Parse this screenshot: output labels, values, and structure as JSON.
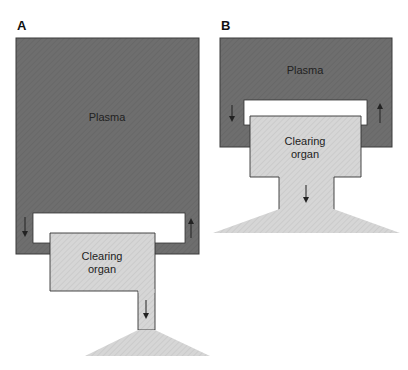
{
  "figure": {
    "panels": [
      {
        "id": "A",
        "label": "A",
        "plasma_label": "Plasma",
        "organ_label_line1": "Clearing",
        "organ_label_line2": "organ",
        "flow_arrows": [
          "down",
          "up",
          "down"
        ]
      },
      {
        "id": "B",
        "label": "B",
        "plasma_label": "Plasma",
        "organ_label_line1": "Clearing",
        "organ_label_line2": "organ",
        "flow_arrows": [
          "down",
          "up",
          "down"
        ]
      }
    ],
    "colors": {
      "plasma": "#6e6e6e",
      "plasma_border": "#3a3a3a",
      "organ": "#d6d6d6",
      "organ_hatch": "#c8c8c8",
      "channel": "#ffffff",
      "outline": "#333333",
      "arrow": "#222222"
    }
  }
}
